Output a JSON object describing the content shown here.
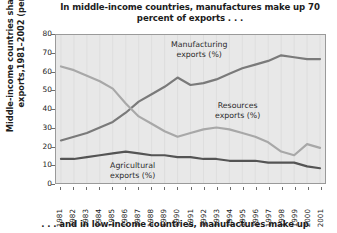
{
  "titles": {
    "top_line1": "In middle-income countries, manufactures make up",
    "top_line2": "70 percent of exports . . .",
    "bottom": ". . . and in low-income countries, manufactures make up"
  },
  "axes": {
    "y_title_line1": "Middle-income countries share of world",
    "y_title_line2": "exports,1981–2002 (percent)",
    "y_ticks": [
      "0",
      "10",
      "20",
      "30",
      "40",
      "50",
      "60",
      "70",
      "80"
    ],
    "x_ticks": [
      "1981",
      "1982",
      "1983",
      "1984",
      "1985",
      "1986",
      "1987",
      "1988",
      "1989",
      "1990",
      "1991",
      "1992",
      "1993",
      "1994",
      "1995",
      "1996",
      "1997",
      "1998",
      "1999",
      "2000",
      "2001"
    ]
  },
  "annotations": {
    "manufacturing_line1": "Manufacturing",
    "manufacturing_line2": "exports (%)",
    "resources_line1": "Resources",
    "resources_line2": "exports (%)",
    "agricultural_line1": "Agricultural",
    "agricultural_line2": "exports (%)"
  },
  "colors": {
    "plot_background": "#e8e8e8",
    "plot_border": "#9a9a9a",
    "manufacturing": "#7a7a7a",
    "resources": "#a8a8a8",
    "agricultural": "#545454",
    "text": "#1c1c1c"
  },
  "chart_data": {
    "type": "line",
    "title": "In middle-income countries, manufactures make up 70 percent of exports . . .",
    "xlabel": "",
    "ylabel": "Middle-income countries share of world exports,1981–2002 (percent)",
    "ylim": [
      0,
      80
    ],
    "ytick_step": 10,
    "grid": false,
    "legend": "inline-annotations",
    "x": [
      "1981",
      "1982",
      "1983",
      "1984",
      "1985",
      "1986",
      "1987",
      "1988",
      "1989",
      "1990",
      "1991",
      "1992",
      "1993",
      "1994",
      "1995",
      "1996",
      "1997",
      "1998",
      "1999",
      "2000",
      "2001"
    ],
    "series": [
      {
        "name": "Manufacturing exports (%)",
        "color": "#7a7a7a",
        "values": [
          23,
          25,
          27,
          30,
          33,
          38,
          44,
          48,
          52,
          57,
          53,
          54,
          56,
          59,
          62,
          64,
          66,
          69,
          68,
          67,
          67
        ]
      },
      {
        "name": "Resources exports (%)",
        "color": "#a8a8a8",
        "values": [
          63,
          61,
          58,
          55,
          51,
          43,
          36,
          32,
          28,
          25,
          27,
          29,
          30,
          29,
          27,
          25,
          22,
          17,
          15,
          21,
          19
        ]
      },
      {
        "name": "Agricultural exports (%)",
        "color": "#545454",
        "values": [
          13,
          13,
          14,
          15,
          16,
          17,
          16,
          15,
          15,
          14,
          14,
          13,
          13,
          12,
          12,
          12,
          11,
          11,
          11,
          9,
          8
        ]
      }
    ]
  }
}
